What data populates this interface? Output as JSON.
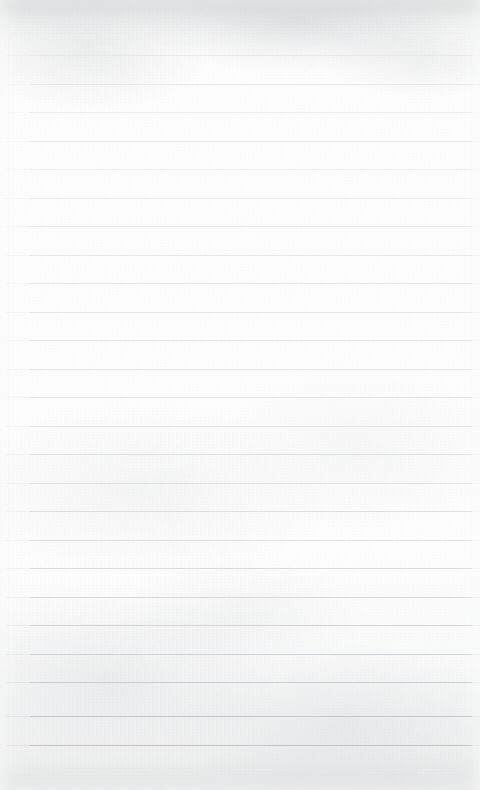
{
  "document": {
    "type": "ruled-notebook-paper",
    "title": "Blank ruled paper sheet",
    "content_text": "",
    "has_handwriting": false,
    "has_printed_text": false,
    "width_px": 480,
    "height_px": 790
  },
  "paper": {
    "background_color": "#fdfdfd",
    "grain_tint_color": "#c8cacd",
    "top_shade_color": "#babcbe",
    "bottom_shade_color": "#c6c8ca"
  },
  "rules": {
    "line_color": "#dcdde0",
    "line_color_bottom": "#c9cbce",
    "line_thickness_px": 1,
    "line_spacing_px": 28.7,
    "first_line_y": 55,
    "left_x": 30,
    "right_x": 472,
    "count": 25,
    "lines": [
      {
        "index": 1,
        "y": 55,
        "left": 30,
        "right": 472,
        "opacity": 0.55,
        "color": "#dfe0e2"
      },
      {
        "index": 2,
        "y": 84,
        "left": 30,
        "right": 472,
        "opacity": 0.6,
        "color": "#dedfe1"
      },
      {
        "index": 3,
        "y": 112,
        "left": 30,
        "right": 472,
        "opacity": 0.58,
        "color": "#dfe0e2"
      },
      {
        "index": 4,
        "y": 141,
        "left": 30,
        "right": 472,
        "opacity": 0.62,
        "color": "#dddee1"
      },
      {
        "index": 5,
        "y": 169,
        "left": 30,
        "right": 472,
        "opacity": 0.58,
        "color": "#dfe0e2"
      },
      {
        "index": 6,
        "y": 198,
        "left": 30,
        "right": 472,
        "opacity": 0.6,
        "color": "#dedfe1"
      },
      {
        "index": 7,
        "y": 226,
        "left": 30,
        "right": 472,
        "opacity": 0.64,
        "color": "#dcdde0"
      },
      {
        "index": 8,
        "y": 255,
        "left": 30,
        "right": 472,
        "opacity": 0.62,
        "color": "#dcdde0"
      },
      {
        "index": 9,
        "y": 283,
        "left": 30,
        "right": 472,
        "opacity": 0.66,
        "color": "#dbdcdf"
      },
      {
        "index": 10,
        "y": 312,
        "left": 30,
        "right": 472,
        "opacity": 0.64,
        "color": "#dbdcdf"
      },
      {
        "index": 11,
        "y": 340,
        "left": 30,
        "right": 472,
        "opacity": 0.68,
        "color": "#d9dade"
      },
      {
        "index": 12,
        "y": 369,
        "left": 30,
        "right": 472,
        "opacity": 0.66,
        "color": "#d9dade"
      },
      {
        "index": 13,
        "y": 397,
        "left": 30,
        "right": 472,
        "opacity": 0.7,
        "color": "#d7d9dc"
      },
      {
        "index": 14,
        "y": 426,
        "left": 30,
        "right": 472,
        "opacity": 0.68,
        "color": "#d7d9dc"
      },
      {
        "index": 15,
        "y": 454,
        "left": 30,
        "right": 472,
        "opacity": 0.72,
        "color": "#d5d7da"
      },
      {
        "index": 16,
        "y": 483,
        "left": 30,
        "right": 472,
        "opacity": 0.7,
        "color": "#d5d7da"
      },
      {
        "index": 17,
        "y": 511,
        "left": 30,
        "right": 472,
        "opacity": 0.74,
        "color": "#d3d5d9"
      },
      {
        "index": 18,
        "y": 540,
        "left": 30,
        "right": 472,
        "opacity": 0.74,
        "color": "#d2d4d8"
      },
      {
        "index": 19,
        "y": 568,
        "left": 30,
        "right": 472,
        "opacity": 0.78,
        "color": "#d0d2d6"
      },
      {
        "index": 20,
        "y": 597,
        "left": 30,
        "right": 472,
        "opacity": 0.8,
        "color": "#cfd1d5"
      },
      {
        "index": 21,
        "y": 625,
        "left": 30,
        "right": 472,
        "opacity": 0.84,
        "color": "#cccfd3"
      },
      {
        "index": 22,
        "y": 654,
        "left": 30,
        "right": 472,
        "opacity": 0.86,
        "color": "#cacdd1"
      },
      {
        "index": 23,
        "y": 682,
        "left": 30,
        "right": 472,
        "opacity": 0.9,
        "color": "#c7cace"
      },
      {
        "index": 24,
        "y": 716,
        "left": 30,
        "right": 472,
        "opacity": 0.94,
        "color": "#c3c6cb"
      },
      {
        "index": 25,
        "y": 745,
        "left": 30,
        "right": 472,
        "opacity": 0.96,
        "color": "#c1c4c9"
      }
    ]
  }
}
